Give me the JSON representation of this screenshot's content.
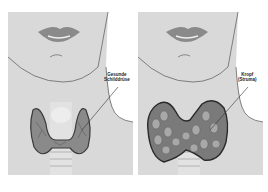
{
  "panels": [
    {
      "id": "healthy",
      "label_line1": "Gesunde",
      "label_line2": "Schilddrüse"
    },
    {
      "id": "goiter",
      "label_line1": "Kropf",
      "label_line2": "(Struma)"
    }
  ],
  "colors": {
    "background": "#d9d9d9",
    "skin_bg": "#ffffff",
    "outline": "#555555",
    "gland": "#8a8a8a",
    "gland_dark": "#3a3a3a"
  }
}
